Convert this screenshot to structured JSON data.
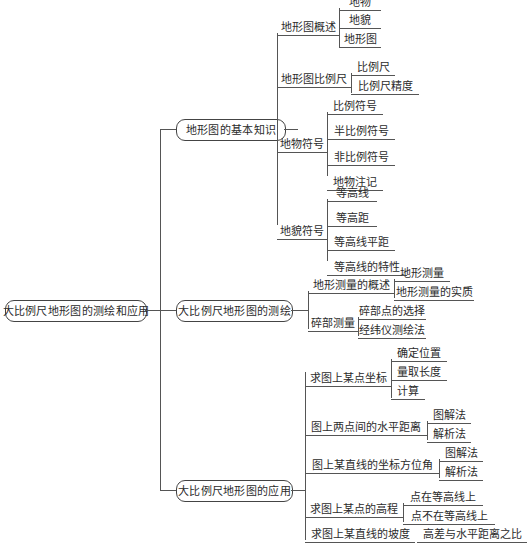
{
  "diagram": {
    "type": "mind-map",
    "title": "大比例尺地形图的测绘和应用",
    "root": {
      "label": "大比例尺地形图的测绘和应用"
    },
    "branches": [
      {
        "label": "地形图的基本知识",
        "children": [
          {
            "label": "地形图概述",
            "leaves": [
              "地物",
              "地貌",
              "地形图"
            ]
          },
          {
            "label": "地形图比例尺",
            "leaves": [
              "比例尺",
              "比例尺精度"
            ]
          },
          {
            "label": "地物符号",
            "leaves": [
              "比例符号",
              "半比例符号",
              "非比例符号",
              "地物注记"
            ]
          },
          {
            "label": "地貌符号",
            "leaves": [
              "等高线",
              "等高距",
              "等高线平距",
              "等高线的特性"
            ]
          }
        ]
      },
      {
        "label": "大比例尺地形图的测绘",
        "children": [
          {
            "label": "地形测量的概述",
            "leaves": [
              "地形测量",
              "地形测量的实质"
            ]
          },
          {
            "label": "碎部测量",
            "leaves": [
              "碎部点的选择",
              "经纬仪测绘法"
            ]
          }
        ]
      },
      {
        "label": "大比例尺地形图的应用",
        "children": [
          {
            "label": "求图上某点坐标",
            "leaves": [
              "确定位置",
              "量取长度",
              "计算"
            ]
          },
          {
            "label": "图上两点间的水平距离",
            "leaves": [
              "图解法",
              "解析法"
            ]
          },
          {
            "label": "图上某直线的坐标方位角",
            "leaves": [
              "图解法",
              "解析法"
            ]
          },
          {
            "label": "求图上某点的高程",
            "leaves": [
              "点在等高线上",
              "点不在等高线上"
            ]
          },
          {
            "label": "求图上某直线的坡度",
            "leaves": [
              "高差与水平距离之比"
            ]
          }
        ]
      }
    ],
    "colors": {
      "line": "#555555",
      "text": "#2b2b2b",
      "background": "#ffffff"
    }
  }
}
